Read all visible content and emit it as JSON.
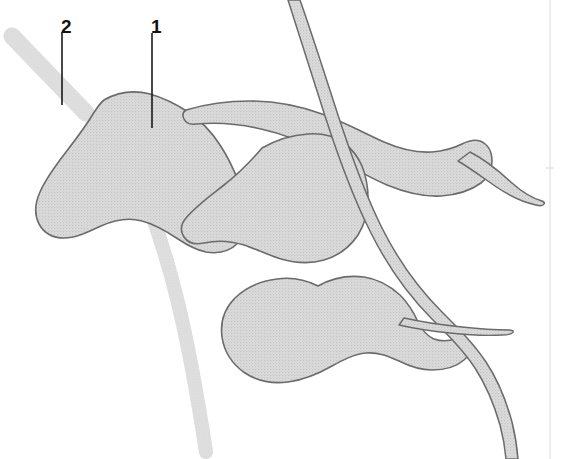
{
  "figure": {
    "type": "anatomical-line-drawing",
    "width": 562,
    "height": 459,
    "background_color": "#ffffff",
    "fill_color": "#d6d6d6",
    "outline_color": "#6b6b6b",
    "vessel_band_color": "#d9d9d9",
    "leader_line_color": "#1a1a1a",
    "label_text_color": "#111111",
    "page_edge_line_color": "#e2e2e2"
  },
  "callouts": [
    {
      "id": "callout-1",
      "label": "1",
      "label_x": 151,
      "label_y": 17,
      "leader_x": 152,
      "leader_y_start": 33,
      "leader_y_end": 128,
      "points_to": "large upper-left lobed mass"
    },
    {
      "id": "callout-2",
      "label": "2",
      "label_x": 61,
      "label_y": 17,
      "leader_x": 62,
      "leader_y_start": 32,
      "leader_y_end": 105,
      "points_to": "diagonal gray band at upper left"
    }
  ],
  "shapes": {
    "lobes": [
      {
        "name": "lobe-upper-left",
        "callout": "1"
      },
      {
        "name": "lobe-middle",
        "callout": null
      },
      {
        "name": "lobe-lower",
        "callout": null
      }
    ],
    "vessels": [
      {
        "name": "vessel-band-upper-left",
        "callout": "2",
        "style": "plain-gray-band"
      },
      {
        "name": "vessel-band-lower-left-curve",
        "callout": null,
        "style": "plain-gray-band"
      },
      {
        "name": "duct-long-arc",
        "callout": null,
        "style": "outlined-tube"
      },
      {
        "name": "duct-upper-right-branch",
        "callout": null,
        "style": "outlined-tube"
      },
      {
        "name": "duct-lower-right-branch",
        "callout": null,
        "style": "outlined-tube"
      },
      {
        "name": "duct-tapered-spur",
        "callout": null,
        "style": "outlined-tube"
      }
    ]
  },
  "page_edge": {
    "visible": true,
    "x": 550
  }
}
